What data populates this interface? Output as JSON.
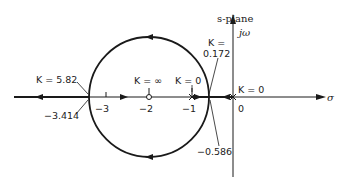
{
  "diagram": {
    "type": "root-locus",
    "plane_label": "s-plane",
    "axis_labels": {
      "imag": "jω",
      "real": "σ"
    },
    "tick_labels": [
      "−3",
      "−2",
      "−1",
      "0"
    ],
    "annotations": {
      "k_582": "K = 5.82",
      "k_inf": "K = ∞",
      "k_0_left": "K = 0",
      "k_0172_line1": "K =",
      "k_0172_line2": "0.172",
      "k_0_origin": "K = 0",
      "breakin": "−3.414",
      "breakaway": "−0.586"
    },
    "poles": [
      -1,
      0
    ],
    "zeros": [
      -2
    ],
    "circle": {
      "center": -2,
      "radius": 1.414
    },
    "colors": {
      "line": "#1a1a1a",
      "background": "#ffffff"
    }
  }
}
